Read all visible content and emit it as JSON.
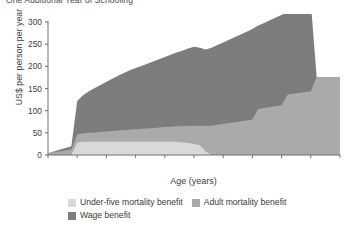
{
  "title": "One Additional Year of Schooling",
  "axes": {
    "ylabel": "US$ per person per year",
    "xlabel": "Age (years)",
    "yticks": [
      "0",
      "50",
      "100",
      "150",
      "200",
      "250",
      "300"
    ],
    "xticks": [
      "14",
      "19",
      "24",
      "29",
      "34",
      "39",
      "44",
      "49",
      "54",
      "59",
      "64"
    ]
  },
  "legend": {
    "items": [
      {
        "label": "Under-five mortality benefit",
        "color": "#d9d9d9"
      },
      {
        "label": "Adult mortality benefit",
        "color": "#aaaaaa"
      },
      {
        "label": "Wage benefit",
        "color": "#7d7d7d"
      }
    ]
  },
  "colors": {
    "under_five": "#d9d9d9",
    "adult": "#aaaaaa",
    "wage": "#7d7d7d",
    "axis": "#6e6e6e",
    "background": "#ffffff"
  },
  "chart_data": {
    "type": "area",
    "stacked": true,
    "title": "One Additional Year of Schooling",
    "xlabel": "Age (years)",
    "ylabel": "US$ per person per year",
    "xlim": [
      14,
      64
    ],
    "ylim": [
      0,
      300
    ],
    "grid": false,
    "legend_position": "bottom-left",
    "x": [
      14,
      15,
      16,
      17,
      18,
      19,
      20,
      21,
      22,
      23,
      24,
      25,
      26,
      27,
      28,
      29,
      30,
      31,
      32,
      33,
      34,
      35,
      36,
      37,
      38,
      39,
      40,
      41,
      42,
      43,
      44,
      45,
      46,
      47,
      48,
      49,
      50,
      51,
      52,
      53,
      54,
      55,
      56,
      57,
      58,
      59,
      60,
      61,
      62,
      63,
      64
    ],
    "series": [
      {
        "name": "Under-five mortality benefit",
        "color": "#d9d9d9",
        "values": [
          0,
          0,
          0,
          0,
          0,
          28,
          30,
          30,
          30,
          30,
          30,
          30,
          30,
          30,
          30,
          30,
          30,
          30,
          30,
          30,
          30,
          30,
          30,
          28,
          27,
          25,
          22,
          8,
          0,
          0,
          0,
          0,
          0,
          0,
          0,
          0,
          0,
          0,
          0,
          0,
          0,
          0,
          0,
          0,
          0,
          0,
          0,
          0,
          0,
          0,
          0
        ]
      },
      {
        "name": "Adult mortality benefit",
        "color": "#aaaaaa",
        "values": [
          4,
          6,
          8,
          10,
          12,
          18,
          19,
          20,
          21,
          22,
          23,
          24,
          25,
          26,
          27,
          28,
          29,
          30,
          31,
          32,
          33,
          34,
          35,
          37,
          39,
          41,
          44,
          58,
          66,
          68,
          70,
          72,
          74,
          76,
          78,
          80,
          104,
          106,
          108,
          110,
          112,
          136,
          138,
          140,
          142,
          144,
          176,
          176,
          176,
          176,
          176
        ]
      },
      {
        "name": "Wage benefit",
        "color": "#7d7d7d",
        "values": [
          0,
          2,
          4,
          6,
          8,
          76,
          86,
          94,
          100,
          106,
          112,
          118,
          124,
          129,
          134,
          138,
          142,
          146,
          150,
          154,
          158,
          162,
          166,
          170,
          174,
          178,
          176,
          172,
          176,
          180,
          184,
          188,
          192,
          196,
          200,
          204,
          188,
          192,
          196,
          200,
          204,
          186,
          190,
          194,
          198,
          200,
          0,
          0,
          0,
          0,
          0
        ]
      }
    ],
    "totals_note": "Stacked total peaks at about 270 US$ near ages 56-59, then falls to about 175 after age 60 when the wage benefit ends."
  }
}
